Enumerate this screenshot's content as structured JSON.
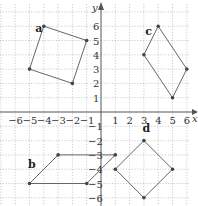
{
  "chart_data": {
    "type": "scatter",
    "title": "",
    "xlabel": "x",
    "ylabel": "y",
    "xlim": [
      -7,
      7
    ],
    "ylim": [
      -7,
      7
    ],
    "grid": true,
    "x_ticks": [
      "-6",
      "-5",
      "-4",
      "-3",
      "-2",
      "-1",
      "1",
      "2",
      "3",
      "4",
      "5",
      "6"
    ],
    "y_ticks": [
      "6",
      "5",
      "4",
      "3",
      "2",
      "1",
      "-1",
      "-2",
      "-3",
      "-4",
      "-5",
      "-6"
    ],
    "shapes": [
      {
        "name": "a",
        "vertices": [
          [
            -4,
            6
          ],
          [
            -1,
            5
          ],
          [
            -2,
            2
          ],
          [
            -5,
            3
          ]
        ],
        "label_pos": [
          -4.6,
          5.6
        ]
      },
      {
        "name": "b",
        "vertices": [
          [
            -5,
            -5
          ],
          [
            -3,
            -3
          ],
          [
            1,
            -3
          ],
          [
            -1,
            -5
          ]
        ],
        "label_pos": [
          -5.1,
          -3.9
        ]
      },
      {
        "name": "c",
        "vertices": [
          [
            4,
            6
          ],
          [
            6,
            3
          ],
          [
            5,
            1
          ],
          [
            3,
            4
          ]
        ],
        "label_pos": [
          3.1,
          5.4
        ]
      },
      {
        "name": "d",
        "vertices": [
          [
            3,
            -2
          ],
          [
            5,
            -4
          ],
          [
            3,
            -6
          ],
          [
            1,
            -4
          ]
        ],
        "label_pos": [
          2.9,
          -1.4
        ]
      }
    ]
  },
  "axes": {
    "x_label": "x",
    "y_label": "y"
  }
}
